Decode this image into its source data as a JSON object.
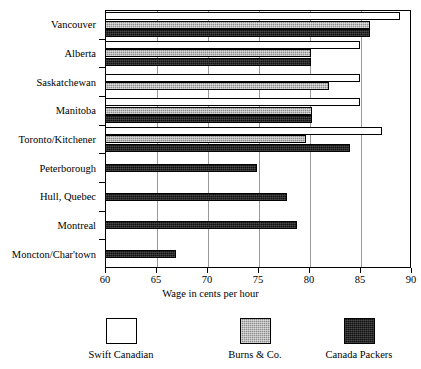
{
  "chart_data": {
    "type": "bar",
    "orientation": "horizontal",
    "title": "",
    "xlabel": "Wage in cents per hour",
    "ylabel": "",
    "xlim": [
      60,
      90
    ],
    "xticks": [
      60,
      65,
      70,
      75,
      80,
      85,
      90
    ],
    "xticklabels": [
      "60",
      "65",
      "70",
      "75",
      "80",
      "85",
      "90"
    ],
    "grid": true,
    "grid_axis": "x",
    "legend_position": "bottom",
    "categories": [
      "Vancouver",
      "Alberta",
      "Saskatchewan",
      "Manitoba",
      "Toronto/Kitchener",
      "Peterborough",
      "Hull, Quebec",
      "Montreal",
      "Moncton/Char'town"
    ],
    "series": [
      {
        "name": "Swift Canadian",
        "color": "#ffffff",
        "pattern": "solid-white",
        "values": [
          88.9,
          85.0,
          85.0,
          85.0,
          87.2,
          null,
          null,
          null,
          null
        ]
      },
      {
        "name": "Burns & Co.",
        "color": "#8e8e8e",
        "pattern": "hatched-gray",
        "values": [
          86.0,
          80.2,
          82.0,
          80.3,
          79.7,
          null,
          null,
          null,
          null
        ]
      },
      {
        "name": "Canada Packers",
        "color": "#111111",
        "pattern": "solid-black",
        "values": [
          86.0,
          80.2,
          null,
          80.3,
          84.0,
          74.9,
          77.8,
          78.8,
          67.0
        ]
      }
    ]
  },
  "legend": {
    "items": [
      {
        "label": "Swift Canadian",
        "swatch": "swift"
      },
      {
        "label": "Burns & Co.",
        "swatch": "burns"
      },
      {
        "label": "Canada Packers",
        "swatch": "packers"
      }
    ]
  },
  "axis": {
    "x_title": "Wage in cents per hour"
  }
}
